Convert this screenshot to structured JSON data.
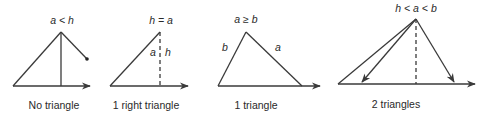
{
  "panels": [
    {
      "id": "no-triangle",
      "condition": "a < h",
      "side_labels": [],
      "caption": "No triangle"
    },
    {
      "id": "one-right-triangle",
      "condition": "h = a",
      "side_labels": [
        "a",
        "h"
      ],
      "caption": "1 right triangle"
    },
    {
      "id": "one-triangle",
      "condition": "a ≥ b",
      "side_labels": [
        "b",
        "a"
      ],
      "caption": "1 triangle"
    },
    {
      "id": "two-triangles",
      "condition": "h < a < b",
      "side_labels": [],
      "caption": "2 triangles"
    }
  ],
  "colors": {
    "line": "#3a3a3a",
    "text": "#2a2a2a",
    "background": "#ffffff"
  }
}
